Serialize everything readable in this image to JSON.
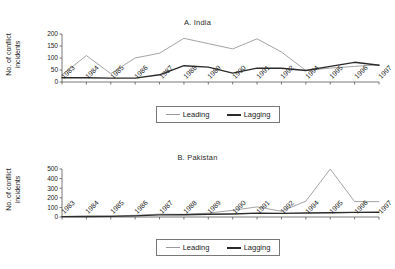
{
  "figure": {
    "background": "#ffffff",
    "series_colors": {
      "leading": "#9a9a9a",
      "lagging": "#2b2b2b"
    }
  },
  "panels": [
    {
      "key": "india",
      "title": "A. India",
      "ylabel": "No. of conflict\nincidents",
      "legend": {
        "leading_label": "Leading",
        "lagging_label": "Lagging"
      }
    },
    {
      "key": "pakistan",
      "title": "B. Pakistan",
      "ylabel": "No. of conflict\nincidents",
      "legend": {
        "leading_label": "Leading",
        "lagging_label": "Lagging"
      }
    }
  ],
  "chart_data": [
    {
      "type": "line",
      "title": "A. India",
      "xlabel": "",
      "ylabel": "No. of conflict incidents",
      "categories": [
        "1983",
        "1984",
        "1985",
        "1986",
        "1987",
        "1988",
        "1989",
        "1990",
        "1991",
        "1992",
        "1994",
        "1995",
        "1996",
        "1997"
      ],
      "yticks": [
        0,
        50,
        100,
        150,
        200
      ],
      "ylim": [
        0,
        200
      ],
      "grid": false,
      "legend_position": "bottom-center",
      "series": [
        {
          "name": "Leading",
          "color": "#9a9a9a",
          "values": [
            30,
            110,
            35,
            100,
            120,
            182,
            160,
            138,
            180,
            125,
            48,
            58,
            65,
            72
          ]
        },
        {
          "name": "Lagging",
          "color": "#2b2b2b",
          "values": [
            18,
            18,
            16,
            16,
            30,
            68,
            62,
            37,
            58,
            57,
            48,
            65,
            82,
            70
          ]
        }
      ]
    },
    {
      "type": "line",
      "title": "B. Pakistan",
      "xlabel": "",
      "ylabel": "No. of conflict incidents",
      "categories": [
        "1983",
        "1984",
        "1985",
        "1986",
        "1987",
        "1988",
        "1989",
        "1990",
        "1991",
        "1992",
        "1994",
        "1995",
        "1996",
        "1997"
      ],
      "yticks": [
        0,
        100,
        200,
        300,
        400,
        500
      ],
      "ylim": [
        0,
        500
      ],
      "grid": false,
      "legend_position": "bottom-center",
      "series": [
        {
          "name": "Leading",
          "color": "#9a9a9a",
          "values": [
            5,
            8,
            10,
            18,
            30,
            28,
            40,
            70,
            105,
            60,
            165,
            500,
            160,
            160
          ]
        },
        {
          "name": "Lagging",
          "color": "#2b2b2b",
          "values": [
            4,
            5,
            7,
            12,
            22,
            24,
            28,
            32,
            40,
            38,
            42,
            45,
            48,
            50
          ]
        }
      ]
    }
  ]
}
